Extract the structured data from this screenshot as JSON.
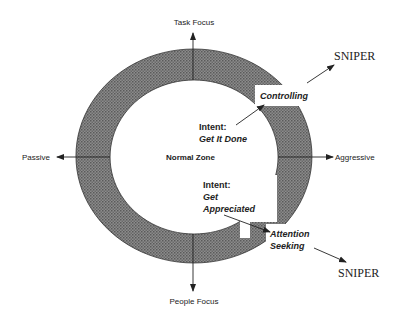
{
  "diagram": {
    "axes": {
      "top": "Task Focus",
      "bottom": "People Focus",
      "left": "Passive",
      "right": "Aggressive"
    },
    "center_label": "Normal Zone",
    "upper": {
      "intent_label": "Intent:",
      "intent_value": "Get It Done",
      "behavior": "Controlling",
      "outcome": "SNIPER"
    },
    "lower": {
      "intent_label": "Intent:",
      "intent_value_line1": "Get",
      "intent_value_line2": "Appreciated",
      "behavior_line1": "Attention",
      "behavior_line2": "Seeking",
      "outcome": "SNIPER"
    },
    "colors": {
      "ring_fill": "#7a7a7a",
      "ink": "#222222",
      "background": "#ffffff"
    }
  }
}
